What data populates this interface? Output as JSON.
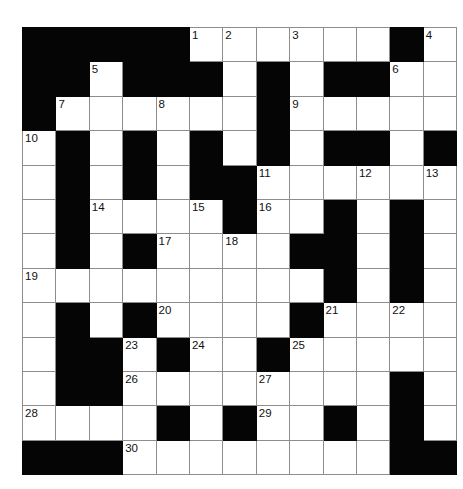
{
  "puzzle": {
    "kind": "crossword-grid",
    "title": "Crossword Puzzle Grid",
    "rows": 13,
    "columns": 13,
    "cell_size_px": 32,
    "colors": {
      "blocked_cell": "#050505",
      "open_cell": "#ffffff",
      "grid_line": "#8d8d8d",
      "number_text": "#111111",
      "page_background": "#ffffff"
    },
    "clue_count": 30,
    "highest_clue_number": 30,
    "clue_numbers_visible": [
      1,
      2,
      3,
      4,
      5,
      6,
      7,
      8,
      9,
      10,
      11,
      12,
      13,
      14,
      15,
      16,
      17,
      18,
      19,
      20,
      21,
      22,
      23,
      24,
      25,
      26,
      27,
      28,
      29,
      30
    ],
    "legend": {
      "blocked": "#",
      "open": "."
    },
    "grid": [
      [
        "#",
        "#",
        "#",
        "#",
        "#",
        ".",
        ".",
        ".",
        ".",
        ".",
        ".",
        "#",
        "."
      ],
      [
        "#",
        "#",
        ".",
        "#",
        "#",
        "#",
        ".",
        "#",
        ".",
        "#",
        "#",
        ".",
        "."
      ],
      [
        "#",
        ".",
        ".",
        ".",
        ".",
        ".",
        ".",
        "#",
        ".",
        ".",
        ".",
        ".",
        "."
      ],
      [
        ".",
        "#",
        ".",
        "#",
        ".",
        "#",
        ".",
        "#",
        ".",
        "#",
        "#",
        ".",
        "#"
      ],
      [
        ".",
        "#",
        ".",
        "#",
        ".",
        "#",
        "#",
        ".",
        ".",
        ".",
        ".",
        ".",
        "."
      ],
      [
        ".",
        "#",
        ".",
        ".",
        ".",
        ".",
        "#",
        ".",
        ".",
        "#",
        ".",
        "#",
        "."
      ],
      [
        ".",
        "#",
        ".",
        "#",
        ".",
        ".",
        ".",
        ".",
        "#",
        "#",
        ".",
        "#",
        "."
      ],
      [
        ".",
        ".",
        ".",
        ".",
        ".",
        ".",
        ".",
        ".",
        ".",
        "#",
        ".",
        "#",
        "."
      ],
      [
        ".",
        "#",
        ".",
        "#",
        ".",
        ".",
        ".",
        ".",
        "#",
        ".",
        ".",
        ".",
        "."
      ],
      [
        ".",
        "#",
        "#",
        ".",
        "#",
        ".",
        ".",
        "#",
        ".",
        ".",
        ".",
        ".",
        "."
      ],
      [
        ".",
        "#",
        "#",
        ".",
        ".",
        ".",
        ".",
        ".",
        ".",
        ".",
        ".",
        "#",
        "."
      ],
      [
        ".",
        ".",
        ".",
        ".",
        "#",
        ".",
        "#",
        ".",
        ".",
        "#",
        ".",
        "#",
        "."
      ],
      [
        "#",
        "#",
        "#",
        ".",
        ".",
        ".",
        ".",
        ".",
        ".",
        ".",
        ".",
        "#",
        "#"
      ]
    ],
    "numbers": [
      {
        "number": 1,
        "row": 0,
        "col": 5
      },
      {
        "number": 2,
        "row": 0,
        "col": 6
      },
      {
        "number": 3,
        "row": 0,
        "col": 8
      },
      {
        "number": 4,
        "row": 0,
        "col": 12
      },
      {
        "number": 5,
        "row": 1,
        "col": 2
      },
      {
        "number": 6,
        "row": 1,
        "col": 11
      },
      {
        "number": 7,
        "row": 2,
        "col": 1
      },
      {
        "number": 8,
        "row": 2,
        "col": 4
      },
      {
        "number": 9,
        "row": 2,
        "col": 8
      },
      {
        "number": 10,
        "row": 3,
        "col": 0
      },
      {
        "number": 11,
        "row": 4,
        "col": 7
      },
      {
        "number": 12,
        "row": 4,
        "col": 10
      },
      {
        "number": 13,
        "row": 4,
        "col": 12
      },
      {
        "number": 14,
        "row": 5,
        "col": 2
      },
      {
        "number": 15,
        "row": 5,
        "col": 5
      },
      {
        "number": 16,
        "row": 5,
        "col": 7
      },
      {
        "number": 17,
        "row": 6,
        "col": 4
      },
      {
        "number": 18,
        "row": 6,
        "col": 6
      },
      {
        "number": 19,
        "row": 7,
        "col": 0
      },
      {
        "number": 20,
        "row": 8,
        "col": 4
      },
      {
        "number": 21,
        "row": 8,
        "col": 9
      },
      {
        "number": 22,
        "row": 8,
        "col": 11
      },
      {
        "number": 23,
        "row": 9,
        "col": 3
      },
      {
        "number": 24,
        "row": 9,
        "col": 5
      },
      {
        "number": 25,
        "row": 9,
        "col": 8
      },
      {
        "number": 26,
        "row": 10,
        "col": 3
      },
      {
        "number": 27,
        "row": 10,
        "col": 7
      },
      {
        "number": 28,
        "row": 11,
        "col": 0
      },
      {
        "number": 29,
        "row": 11,
        "col": 7
      },
      {
        "number": 30,
        "row": 12,
        "col": 3
      }
    ],
    "entries": []
  }
}
